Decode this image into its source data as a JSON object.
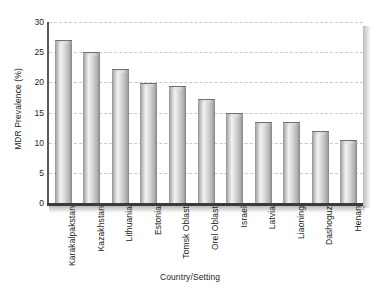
{
  "chart_data": {
    "type": "bar",
    "title": "",
    "xlabel": "Country/Setting",
    "ylabel": "MDR Prevalence (%)",
    "categories": [
      "Karakalpakstan",
      "Kazakhstan",
      "Lithuania",
      "Estonia",
      "Tomsk Oblast",
      "Orel Oblast",
      "Israel",
      "Latvia",
      "Liaoning",
      "Dashoguz",
      "Henan"
    ],
    "values": [
      27.0,
      25.0,
      22.2,
      19.9,
      19.4,
      17.2,
      14.9,
      13.4,
      13.4,
      12.0,
      10.5
    ],
    "ylim": [
      0,
      30
    ],
    "yticks": [
      0,
      5,
      10,
      15,
      20,
      25,
      30
    ],
    "ytick_labels": [
      "0",
      "5",
      "10",
      "15",
      "20",
      "25",
      "30"
    ],
    "grid": true,
    "legend": "none",
    "bar_color": "#c9cacb"
  },
  "colors": {
    "axis": "#3b3b3d",
    "grid": "#c9c9cb",
    "text": "#231f20",
    "background": "#ffffff"
  }
}
